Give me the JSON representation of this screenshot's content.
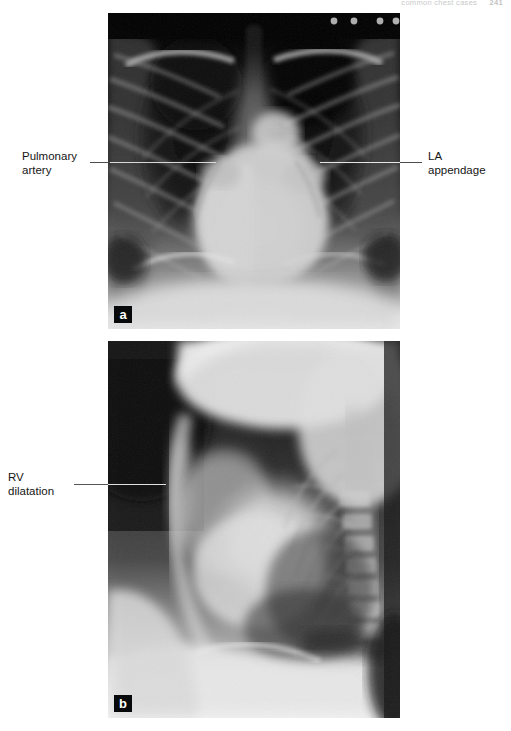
{
  "page": {
    "running_head": "common chest cases",
    "page_number": "241",
    "background_color": "#ffffff"
  },
  "figure": {
    "panels": [
      {
        "tag": "a",
        "view": "PA chest radiograph",
        "annotations": [
          {
            "id": "pulmonary-artery",
            "label": "Pulmonary\nartery",
            "side": "left"
          },
          {
            "id": "la-appendage",
            "label": "LA\nappendage",
            "side": "right"
          }
        ]
      },
      {
        "tag": "b",
        "view": "Lateral chest radiograph",
        "annotations": [
          {
            "id": "rv-dilatation",
            "label": "RV\ndilatation",
            "side": "left"
          }
        ]
      }
    ],
    "leader_line_color": "#e0e0e0",
    "tag_background_color": "#07090a",
    "tag_text_color": "#ffffff"
  }
}
